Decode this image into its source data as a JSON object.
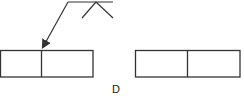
{
  "diagram": {
    "type": "weld-symbol-sketch",
    "label": "D",
    "colors": {
      "stroke": "#333333",
      "background": "#ffffff"
    },
    "reference_line": {
      "x1": 68,
      "y1": 2,
      "x2": 113,
      "y2": 2
    },
    "arrow_leader": {
      "from": [
        68,
        2
      ],
      "to": [
        42,
        49
      ]
    },
    "weld_symbol": {
      "apex": [
        96,
        2
      ],
      "left": [
        82,
        18
      ],
      "right": [
        113,
        18
      ]
    },
    "left_assembly": {
      "x": 0,
      "y": 50,
      "width": 93,
      "height": 27,
      "divider_x": 41
    },
    "right_assembly": {
      "x": 135,
      "y": 50,
      "width": 105,
      "height": 27,
      "divider_x": 187
    }
  }
}
